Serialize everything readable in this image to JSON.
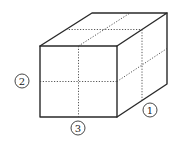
{
  "diagram": {
    "type": "cuboid-cross-sections",
    "labels": [
      {
        "id": "1",
        "text": "1",
        "position": "right-bottom, along depth edge"
      },
      {
        "id": "2",
        "text": "2",
        "position": "left, beside front face horizontal cut"
      },
      {
        "id": "3",
        "text": "3",
        "position": "bottom, below front face vertical cut"
      }
    ],
    "colors": {
      "line": "#2a2a2a",
      "dotted": "#444444",
      "background": "#ffffff"
    }
  }
}
